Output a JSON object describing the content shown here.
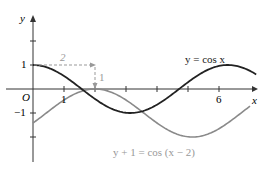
{
  "chart_data": {
    "type": "line",
    "title": "",
    "xlabel": "x",
    "ylabel": "y",
    "origin_label": "O",
    "x_ticks": [
      1,
      2,
      3,
      4,
      5,
      6
    ],
    "x_tick_labels": [
      {
        "value": 1,
        "label": "1"
      },
      {
        "value": 6,
        "label": "6"
      }
    ],
    "y_ticks": [
      2,
      1,
      -1,
      -2
    ],
    "y_tick_labels": [
      {
        "value": 1,
        "label": "1"
      },
      {
        "value": -1,
        "label": "-1"
      }
    ],
    "xlim": [
      -1,
      7.2
    ],
    "ylim": [
      -3,
      3
    ],
    "grid": false,
    "series": [
      {
        "name": "y = cos x",
        "expr": "cos(x)",
        "color": "#222222",
        "domain": [
          0,
          7.2
        ]
      },
      {
        "name": "y + 1 = cos (x − 2)",
        "expr": "cos(x-2)-1",
        "color": "#8a8a8a",
        "domain": [
          0,
          7.0
        ]
      }
    ],
    "annotations": [
      {
        "type": "dashed-arrow",
        "from": [
          0,
          1
        ],
        "to": [
          2,
          1
        ],
        "label": "2"
      },
      {
        "type": "dashed-arrow",
        "from": [
          2,
          1
        ],
        "to": [
          2,
          0
        ],
        "label": "1"
      }
    ]
  },
  "labels": {
    "y_axis": "y",
    "x_axis": "x",
    "origin": "O",
    "tick_1x": "1",
    "tick_6x": "6",
    "tick_1y": "1",
    "tick_m1y": "−1",
    "shift_h": "2",
    "shift_v": "1",
    "curve_black": "y = cos x",
    "curve_gray": "y + 1 = cos (x − 2)"
  }
}
